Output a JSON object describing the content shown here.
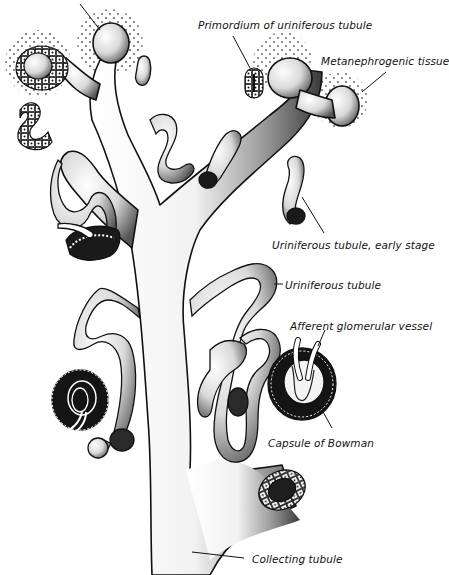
{
  "diagram": {
    "colors": {
      "ink": "#111111",
      "background": "#ffffff",
      "shade": "#555555",
      "dark": "#1a1a1a"
    },
    "labels": [
      {
        "id": "primordium",
        "text": "Primordium of uriniferous tubule",
        "x": 198,
        "y": 18
      },
      {
        "id": "metanephrogenic-prefix",
        "text": "Meta",
        "x": 321,
        "y": 55
      },
      {
        "id": "metanephrogenic-bold",
        "text": "n",
        "x": 0,
        "y": 0
      },
      {
        "id": "metanephrogenic",
        "text": "Metanephrogenic tissue",
        "x": 321,
        "y": 55
      },
      {
        "id": "uriniferous-early",
        "text": "Uriniferous tubule, early stage",
        "x": 272,
        "y": 239
      },
      {
        "id": "uriniferous",
        "text": "Uriniferous tubule",
        "x": 285,
        "y": 280
      },
      {
        "id": "afferent",
        "text": "Afferent glomerular vessel",
        "x": 290,
        "y": 321
      },
      {
        "id": "bowman",
        "text": "Capsule of Bowman",
        "x": 268,
        "y": 437
      },
      {
        "id": "collecting",
        "text": "Collecting tubule",
        "x": 252,
        "y": 554
      }
    ]
  }
}
